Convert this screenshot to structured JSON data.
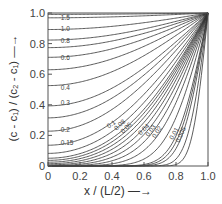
{
  "chart_data": {
    "type": "line",
    "title": "",
    "xlabel": "x / (L/2) —→",
    "ylabel": "(c - c₁) / (c₂ - c₁) —→",
    "xlim": [
      0,
      1.0
    ],
    "ylim": [
      0,
      1.0
    ],
    "x_ticks": [
      "0",
      "0.2",
      "0.4",
      "0.6",
      "0.8",
      "1.0"
    ],
    "y_ticks": [
      "0",
      "0.2",
      "0.4",
      "0.6",
      "0.8",
      "1.0"
    ],
    "grid": false,
    "legend": "none (curves labelled inline)",
    "curve_parameter": "Dt/l²",
    "series": [
      {
        "name": "1.5",
        "label_pos": [
          0.08,
          0.955
        ]
      },
      {
        "name": "1.0",
        "label_pos": [
          0.08,
          0.885
        ]
      },
      {
        "name": "0.8",
        "label_pos": [
          0.08,
          0.805
        ]
      },
      {
        "name": "0.6",
        "label_pos": [
          0.08,
          0.69
        ]
      },
      {
        "name": "0.4",
        "label_pos": [
          0.08,
          0.5
        ]
      },
      {
        "name": "0.3",
        "label_pos": [
          0.08,
          0.4
        ]
      },
      {
        "name": "0.2",
        "label_pos": [
          0.08,
          0.22
        ]
      },
      {
        "name": "0.15",
        "label_pos": [
          0.08,
          0.14
        ]
      },
      {
        "name": "0.1",
        "label_pos": [
          0.38,
          0.245
        ],
        "rot": -35
      },
      {
        "name": "0.08",
        "label_pos": [
          0.43,
          0.23
        ],
        "rot": -45
      },
      {
        "name": "0.06",
        "label_pos": [
          0.47,
          0.21
        ],
        "rot": -45
      },
      {
        "name": "0.04",
        "label_pos": [
          0.58,
          0.2
        ],
        "rot": -45
      },
      {
        "name": "0.03",
        "label_pos": [
          0.63,
          0.19
        ],
        "rot": -55
      },
      {
        "name": "0.02",
        "label_pos": [
          0.67,
          0.18
        ],
        "rot": -55
      },
      {
        "name": "0.01",
        "label_pos": [
          0.78,
          0.17
        ],
        "rot": -60
      },
      {
        "name": "0.005",
        "label_pos": [
          0.82,
          0.15
        ],
        "rot": -65
      }
    ],
    "extra_curves": [
      0.012,
      0.008,
      0.003,
      0.05,
      0.07,
      0.09,
      0.12,
      0.25,
      0.5,
      0.7,
      2.0
    ]
  }
}
